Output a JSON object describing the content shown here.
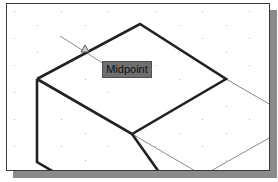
{
  "viewport": {
    "background": "#ffffff",
    "grid_dot_color": "#b8b8b8"
  },
  "snap": {
    "tooltip_label": "Midpoint",
    "marker": "midpoint-triangle-icon"
  },
  "colors": {
    "thick_line": "#222222",
    "thin_line": "#8a8a8a",
    "tooltip_bg": "#6f6f6f",
    "shadow": "#8a8a8a"
  }
}
